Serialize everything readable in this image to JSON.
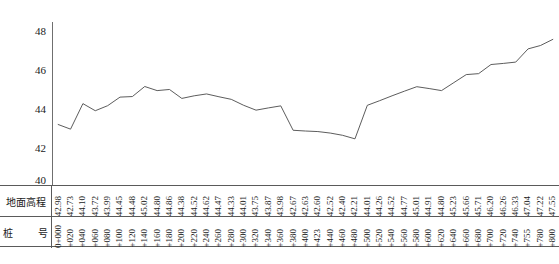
{
  "chart_data": {
    "type": "line",
    "title": "",
    "xlabel": "",
    "ylabel": "",
    "ylim": [
      40,
      48.8
    ],
    "yticks": [
      "40",
      "42",
      "44",
      "46",
      "48"
    ],
    "grid": false,
    "legend": "none",
    "series_name": "地面高程",
    "categories": [
      "0+000",
      "+020",
      "+040",
      "+060",
      "+080",
      "+100",
      "+120",
      "+140",
      "+160",
      "+180",
      "+200",
      "+220",
      "+240",
      "+260",
      "+280",
      "+300",
      "+320",
      "+340",
      "+360",
      "+380",
      "+400",
      "+423",
      "+440",
      "+460",
      "+480",
      "+500",
      "+520",
      "+540",
      "+560",
      "+580",
      "+600",
      "+620",
      "+640",
      "+660",
      "+680",
      "+700",
      "+720",
      "+740",
      "+755",
      "+780",
      "+800"
    ],
    "values": [
      42.98,
      42.73,
      44.1,
      43.72,
      43.99,
      44.45,
      44.48,
      45.02,
      44.8,
      44.86,
      44.38,
      44.52,
      44.62,
      44.47,
      44.33,
      44.01,
      43.75,
      43.87,
      43.98,
      42.67,
      42.63,
      42.6,
      42.52,
      42.4,
      42.21,
      44.01,
      44.26,
      44.52,
      44.77,
      45.01,
      44.91,
      44.8,
      45.23,
      45.66,
      45.71,
      46.2,
      46.26,
      46.33,
      47.04,
      47.22,
      47.55
    ],
    "line_color": "#4a4a4a"
  },
  "table": {
    "row_elevation_label": "地面高程",
    "row_station_label_left": "桩",
    "row_station_label_right": "号"
  },
  "caption": {
    "text": ""
  }
}
